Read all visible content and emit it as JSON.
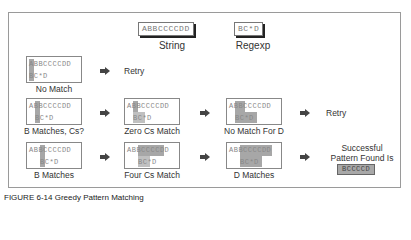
{
  "legend": {
    "string_value": "ABBCCCCDD",
    "string_label": "String",
    "regexp_value": "BC*D",
    "regexp_label": "Regexp"
  },
  "rows": [
    {
      "steps": [
        {
          "string": "ABBCCCCDD",
          "regexp": "BC*D",
          "caption": "No Match"
        }
      ],
      "outcome": "Retry"
    },
    {
      "steps": [
        {
          "string": "ABBCCCCDD",
          "regexp": "BC*D",
          "caption": "B Matches, Cs?"
        },
        {
          "string": "ABBCCCCDD",
          "regexp": "BC*D",
          "caption": "Zero Cs Match"
        },
        {
          "string": "ABBCCCCDD",
          "regexp": "BC*D",
          "caption": "No Match For D"
        }
      ],
      "outcome": "Retry"
    },
    {
      "steps": [
        {
          "string": "ABBCCCCDD",
          "regexp": "BC*D",
          "caption": "B Matches"
        },
        {
          "string": "ABBCCCCDD",
          "regexp": "BC*D",
          "caption": "Four Cs Match"
        },
        {
          "string": "ABBCCCCDD",
          "regexp": "BC*D",
          "caption": "D Matches"
        }
      ],
      "outcome_line1": "Successful",
      "outcome_line2": "Pattern Found Is",
      "result": "BCCCCD"
    }
  ],
  "figure_caption": "FIGURE 6-14   Greedy Pattern Matching",
  "colors": {
    "highlight": "#8a8a8a",
    "frame": "#9a9a9a",
    "arrow": "#444444"
  }
}
